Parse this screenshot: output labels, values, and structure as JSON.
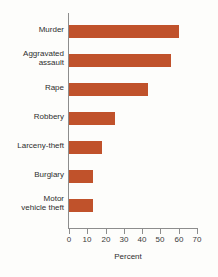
{
  "chart_data": {
    "type": "bar",
    "orientation": "horizontal",
    "title": "",
    "xlabel": "Percent",
    "ylabel": "",
    "xlim": [
      0,
      70
    ],
    "grid": false,
    "legend": false,
    "bar_color": "#c0522b",
    "axis_color": "#8d8d8d",
    "categories": [
      "Murder",
      "Aggravated assault",
      "Rape",
      "Robbery",
      "Larceny-theft",
      "Burglary",
      "Motor vehicle theft"
    ],
    "values": [
      60,
      56,
      43,
      25,
      18,
      13,
      13
    ],
    "xticks": [
      0,
      10,
      20,
      30,
      40,
      50,
      60,
      70
    ],
    "xticklabels": [
      "0",
      "10",
      "20",
      "30",
      "40",
      "50",
      "60",
      "70"
    ],
    "bars": [
      {
        "label_line1": "Murder",
        "label_line2": "",
        "value": 60
      },
      {
        "label_line1": "Aggravated",
        "label_line2": "assault",
        "value": 56
      },
      {
        "label_line1": "Rape",
        "label_line2": "",
        "value": 43
      },
      {
        "label_line1": "Robbery",
        "label_line2": "",
        "value": 25
      },
      {
        "label_line1": "Larceny-theft",
        "label_line2": "",
        "value": 18
      },
      {
        "label_line1": "Burglary",
        "label_line2": "",
        "value": 13
      },
      {
        "label_line1": "Motor",
        "label_line2": "vehicle theft",
        "value": 13
      }
    ]
  }
}
